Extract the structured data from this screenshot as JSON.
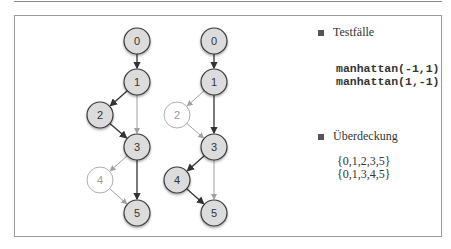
{
  "diagram": {
    "type": "control-flow-graphs",
    "graphs": [
      {
        "name": "path-1",
        "nodes": [
          {
            "id": "0",
            "label": "0",
            "x": 137,
            "y": 41,
            "covered": true
          },
          {
            "id": "1",
            "label": "1",
            "x": 137,
            "y": 82,
            "covered": true
          },
          {
            "id": "2",
            "label": "2",
            "x": 100,
            "y": 115,
            "covered": true
          },
          {
            "id": "3",
            "label": "3",
            "x": 137,
            "y": 147,
            "covered": true
          },
          {
            "id": "4",
            "label": "4",
            "x": 100,
            "y": 180,
            "covered": false
          },
          {
            "id": "5",
            "label": "5",
            "x": 137,
            "y": 213,
            "covered": true
          }
        ],
        "edges": [
          {
            "from": "0",
            "to": "1",
            "covered": true
          },
          {
            "from": "1",
            "to": "2",
            "covered": true
          },
          {
            "from": "1",
            "to": "3",
            "covered": false
          },
          {
            "from": "2",
            "to": "3",
            "covered": true
          },
          {
            "from": "3",
            "to": "4",
            "covered": false
          },
          {
            "from": "3",
            "to": "5",
            "covered": true
          },
          {
            "from": "4",
            "to": "5",
            "covered": false
          }
        ]
      },
      {
        "name": "path-2",
        "nodes": [
          {
            "id": "0",
            "label": "0",
            "x": 214,
            "y": 41,
            "covered": true
          },
          {
            "id": "1",
            "label": "1",
            "x": 214,
            "y": 82,
            "covered": true
          },
          {
            "id": "2",
            "label": "2",
            "x": 177,
            "y": 115,
            "covered": false
          },
          {
            "id": "3",
            "label": "3",
            "x": 214,
            "y": 147,
            "covered": true
          },
          {
            "id": "4",
            "label": "4",
            "x": 177,
            "y": 180,
            "covered": true
          },
          {
            "id": "5",
            "label": "5",
            "x": 214,
            "y": 213,
            "covered": true
          }
        ],
        "edges": [
          {
            "from": "0",
            "to": "1",
            "covered": true
          },
          {
            "from": "1",
            "to": "2",
            "covered": false
          },
          {
            "from": "1",
            "to": "3",
            "covered": true
          },
          {
            "from": "2",
            "to": "3",
            "covered": false
          },
          {
            "from": "3",
            "to": "4",
            "covered": true
          },
          {
            "from": "3",
            "to": "5",
            "covered": false
          },
          {
            "from": "4",
            "to": "5",
            "covered": true
          }
        ]
      }
    ]
  },
  "legend": {
    "testcases_label": "Testfälle",
    "testcases": [
      "manhattan(-1,1)",
      "manhattan(1,-1)"
    ],
    "coverage_label": "Überdeckung",
    "coverage_sets": [
      "{0,1,2,3,5}",
      "{0,1,3,4,5}"
    ]
  },
  "colors": {
    "node_fill": "#dcdcdc",
    "node_stroke": "#3a3a3a",
    "uncovered_stroke": "#9a9a9a",
    "edge_dark": "#333333",
    "edge_light": "#a0a0a0"
  }
}
